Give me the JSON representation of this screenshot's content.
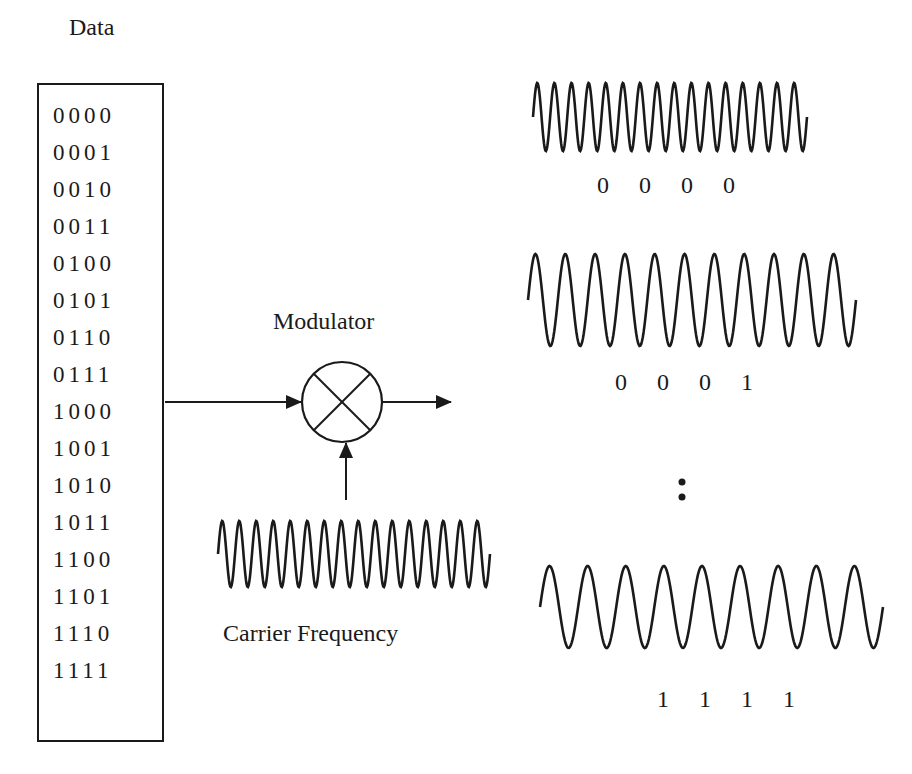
{
  "diagram": {
    "title": "Data",
    "data_codes": [
      "0000",
      "0001",
      "0010",
      "0011",
      "0100",
      "0101",
      "0110",
      "0111",
      "1000",
      "1001",
      "1010",
      "1011",
      "1100",
      "1101",
      "1110",
      "1111"
    ],
    "modulator_label": "Modulator",
    "carrier_label": "Carrier Frequency",
    "outputs": [
      {
        "code": "0 0 0 0",
        "cycles": 16
      },
      {
        "code": "0 0 0 1",
        "cycles": 11
      },
      {
        "code": "1 1 1 1",
        "cycles": 9
      }
    ],
    "ellipsis": ":",
    "carrier_cycles": 16,
    "colors": {
      "stroke": "#1a1a1a",
      "background": "#ffffff"
    }
  }
}
